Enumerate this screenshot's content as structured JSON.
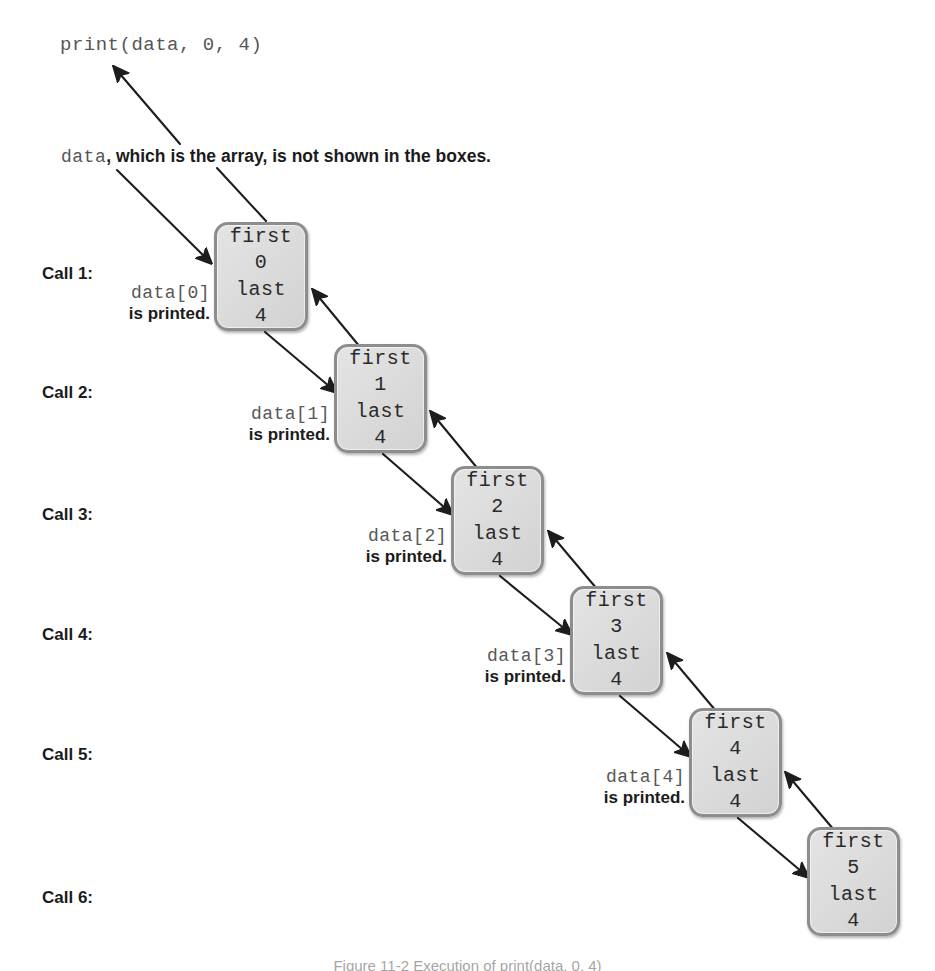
{
  "page": {
    "print_call": "print(data, 0, 4)",
    "array_note_code": "data",
    "array_note_rest": ", which is the array, is not shown in the boxes.",
    "caption": "Figure 11-2  Execution of print(data, 0, 4)"
  },
  "colors": {
    "box_fill": "#dcdcdc",
    "box_border": "#8d8d8d",
    "arrow": "#1d1d1d",
    "code_text": "#565656",
    "body_text": "#1b1b1b"
  },
  "calls": [
    {
      "label": "Call 1:",
      "top": 264
    },
    {
      "label": "Call 2:",
      "top": 383
    },
    {
      "label": "Call 3:",
      "top": 505
    },
    {
      "label": "Call 4:",
      "top": 625
    },
    {
      "label": "Call 5:",
      "top": 745
    },
    {
      "label": "Call 6:",
      "top": 888
    }
  ],
  "frames": [
    {
      "first_field": "first",
      "first_value": "0",
      "last_field": "last",
      "last_value": "4",
      "x": 214,
      "y": 222,
      "w": 94,
      "h": 109
    },
    {
      "first_field": "first",
      "first_value": "1",
      "last_field": "last",
      "last_value": "4",
      "x": 334,
      "y": 344,
      "w": 93,
      "h": 109
    },
    {
      "first_field": "first",
      "first_value": "2",
      "last_field": "last",
      "last_value": "4",
      "x": 451,
      "y": 466,
      "w": 93,
      "h": 109
    },
    {
      "first_field": "first",
      "first_value": "3",
      "last_field": "last",
      "last_value": "4",
      "x": 570,
      "y": 586,
      "w": 93,
      "h": 109
    },
    {
      "first_field": "first",
      "first_value": "4",
      "last_field": "last",
      "last_value": "4",
      "x": 689,
      "y": 708,
      "w": 93,
      "h": 109
    },
    {
      "first_field": "first",
      "first_value": "5",
      "last_field": "last",
      "last_value": "4",
      "x": 807,
      "y": 827,
      "w": 93,
      "h": 109
    }
  ],
  "printed_notes": [
    {
      "index_text": "data[0]",
      "printed_text": "is printed.",
      "right": 725,
      "top": 283
    },
    {
      "index_text": "data[1]",
      "printed_text": "is printed.",
      "right": 605,
      "top": 404
    },
    {
      "index_text": "data[2]",
      "printed_text": "is printed.",
      "right": 488,
      "top": 526
    },
    {
      "index_text": "data[3]",
      "printed_text": "is printed.",
      "right": 369,
      "top": 646
    },
    {
      "index_text": "data[4]",
      "printed_text": "is printed.",
      "right": 250,
      "top": 767
    }
  ],
  "arrows": {
    "to_print_call": {
      "x1": 180,
      "y1": 144,
      "x2": 114,
      "y2": 67
    },
    "note_to_box1_left": {
      "x1": 117,
      "y1": 170,
      "x2": 211,
      "y2": 263
    },
    "note_to_box1_top": {
      "x1": 217,
      "y1": 168,
      "x2": 266,
      "y2": 221
    },
    "calls": [
      {
        "down": {
          "x1": 265,
          "y1": 332,
          "x2": 336,
          "y2": 392
        },
        "up": {
          "x1": 360,
          "y1": 347,
          "x2": 313,
          "y2": 290
        }
      },
      {
        "down": {
          "x1": 383,
          "y1": 454,
          "x2": 452,
          "y2": 514
        },
        "up": {
          "x1": 478,
          "y1": 469,
          "x2": 431,
          "y2": 412
        }
      },
      {
        "down": {
          "x1": 500,
          "y1": 576,
          "x2": 571,
          "y2": 634
        },
        "up": {
          "x1": 597,
          "y1": 589,
          "x2": 549,
          "y2": 532
        }
      },
      {
        "down": {
          "x1": 620,
          "y1": 696,
          "x2": 690,
          "y2": 756
        },
        "up": {
          "x1": 716,
          "y1": 711,
          "x2": 668,
          "y2": 654
        }
      },
      {
        "down": {
          "x1": 738,
          "y1": 818,
          "x2": 808,
          "y2": 877
        },
        "up": {
          "x1": 834,
          "y1": 830,
          "x2": 786,
          "y2": 773
        }
      }
    ]
  }
}
